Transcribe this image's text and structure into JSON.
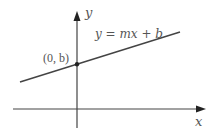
{
  "diagram": {
    "axes": {
      "x_label": "x",
      "y_label": "y",
      "color": "#333333"
    },
    "line": {
      "equation_label": "y = mx + b",
      "color": "#444444"
    },
    "point": {
      "label": "(0, b)",
      "color": "#222222"
    }
  }
}
